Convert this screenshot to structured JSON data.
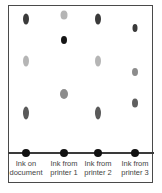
{
  "diagram": {
    "type": "paper-chromatography",
    "lanes": [
      {
        "id": "document",
        "label_line1": "Ink on",
        "label_line2": "document",
        "x": 26,
        "spots": [
          {
            "y": 19,
            "w": 6,
            "h": 11,
            "color": "#3a3a3a"
          },
          {
            "y": 61,
            "w": 6,
            "h": 11,
            "color": "#b5b5b5"
          },
          {
            "y": 113,
            "w": 6,
            "h": 13,
            "color": "#5a5a5a"
          }
        ]
      },
      {
        "id": "printer1",
        "label_line1": "Ink from",
        "label_line2": "printer 1",
        "x": 64,
        "spots": [
          {
            "y": 15,
            "w": 7,
            "h": 9,
            "color": "#b5b5b5"
          },
          {
            "y": 40,
            "w": 6,
            "h": 8,
            "color": "#151515"
          },
          {
            "y": 94,
            "w": 8,
            "h": 10,
            "color": "#8c8c8c"
          }
        ]
      },
      {
        "id": "printer2",
        "label_line1": "Ink from",
        "label_line2": "printer 2",
        "x": 98,
        "spots": [
          {
            "y": 19,
            "w": 6,
            "h": 11,
            "color": "#3a3a3a"
          },
          {
            "y": 61,
            "w": 6,
            "h": 11,
            "color": "#b5b5b5"
          },
          {
            "y": 113,
            "w": 6,
            "h": 13,
            "color": "#5a5a5a"
          }
        ]
      },
      {
        "id": "printer3",
        "label_line1": "Ink from",
        "label_line2": "printer 3",
        "x": 135,
        "spots": [
          {
            "y": 28,
            "w": 5,
            "h": 8,
            "color": "#3a3a3a"
          },
          {
            "y": 72,
            "w": 6,
            "h": 8,
            "color": "#8c8c8c"
          },
          {
            "y": 103,
            "w": 6,
            "h": 9,
            "color": "#5f5f5f"
          }
        ]
      }
    ],
    "baseline_y": 153,
    "origin_color": "#111111"
  }
}
